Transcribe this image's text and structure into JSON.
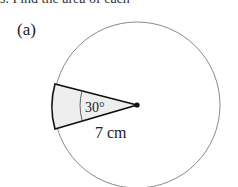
{
  "question": {
    "top_text": "s. Find the area of each",
    "part_label": "(a)"
  },
  "figure": {
    "angle_label": "30°",
    "radius_label": "7 cm",
    "sector_angle_deg": 30,
    "radius_value": 7,
    "radius_unit": "cm",
    "sector_fill": "#eeeeee",
    "circle_stroke": "#888888",
    "sector_stroke": "#111111"
  }
}
